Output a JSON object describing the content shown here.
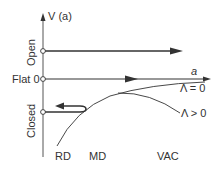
{
  "diagram": {
    "y_axis_label": "V (a)",
    "x_axis_label": "a",
    "levels": [
      {
        "id": "open",
        "label": "Open"
      },
      {
        "id": "flat",
        "label": "Flat 0"
      },
      {
        "id": "closed",
        "label": "Closed"
      }
    ],
    "curves": [
      {
        "id": "lambda-zero",
        "label": "Λ = 0"
      },
      {
        "id": "lambda-positive",
        "label": "Λ > 0"
      }
    ],
    "eras": [
      {
        "id": "rd",
        "label": "RD"
      },
      {
        "id": "md",
        "label": "MD"
      },
      {
        "id": "vac",
        "label": "VAC"
      }
    ],
    "colors": {
      "line": "#333333",
      "background": "#ffffff"
    }
  }
}
